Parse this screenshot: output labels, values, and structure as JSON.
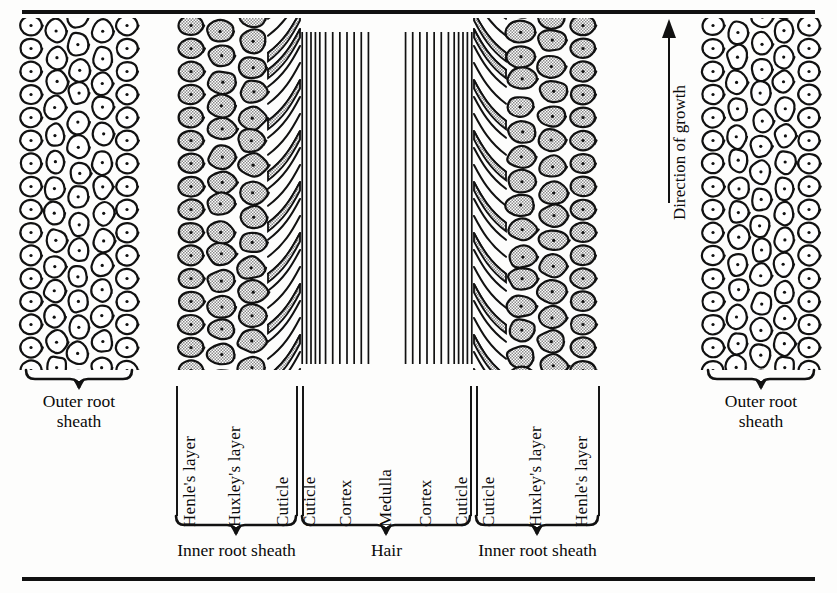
{
  "figure": {
    "background_color": "#fdfdfc",
    "ink_color": "#111111",
    "cell_fill_outer": "#ffffff",
    "cell_fill_inner": "#b8b8b8",
    "growth_arrow": {
      "label": "Direction of growth",
      "direction": "up",
      "icon": "up-arrow-icon"
    },
    "columns": [
      {
        "id": "outer-root-sheath-left",
        "label": "Outer root sheath",
        "kind": "cells-white"
      },
      {
        "id": "henles-layer-left",
        "label": "Henle's layer",
        "kind": "cells-gray"
      },
      {
        "id": "huxleys-layer-left",
        "label": "Huxley's layer",
        "kind": "cells-gray"
      },
      {
        "id": "irs-cuticle-left",
        "label": "Cuticle",
        "kind": "scales"
      },
      {
        "id": "hair-cuticle-left",
        "label": "Cuticle",
        "kind": "striation"
      },
      {
        "id": "cortex-left",
        "label": "Cortex",
        "kind": "striation"
      },
      {
        "id": "medulla",
        "label": "Medulla",
        "kind": "plain"
      },
      {
        "id": "cortex-right",
        "label": "Cortex",
        "kind": "striation"
      },
      {
        "id": "hair-cuticle-right",
        "label": "Cuticle",
        "kind": "striation"
      },
      {
        "id": "irs-cuticle-right",
        "label": "Cuticle",
        "kind": "scales"
      },
      {
        "id": "huxleys-layer-right",
        "label": "Huxley's layer",
        "kind": "cells-gray"
      },
      {
        "id": "henles-layer-right",
        "label": "Henle's layer",
        "kind": "cells-gray"
      },
      {
        "id": "outer-root-sheath-right",
        "label": "Outer root sheath",
        "kind": "cells-white"
      }
    ],
    "groups": [
      {
        "id": "group-inner-root-sheath-left",
        "label": "Inner root sheath"
      },
      {
        "id": "group-hair",
        "label": "Hair"
      },
      {
        "id": "group-inner-root-sheath-right",
        "label": "Inner root sheath"
      }
    ],
    "outer_labels": [
      {
        "id": "outer-left",
        "line1": "Outer root",
        "line2": "sheath"
      },
      {
        "id": "outer-right",
        "line1": "Outer root",
        "line2": "sheath"
      }
    ]
  }
}
